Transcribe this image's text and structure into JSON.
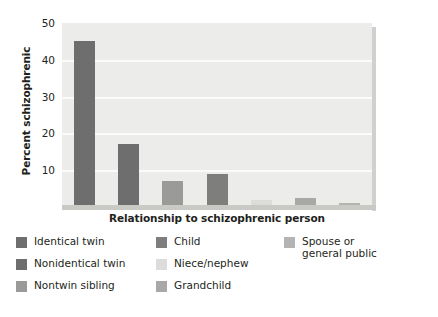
{
  "chart_data": {
    "type": "bar",
    "title": "",
    "xlabel": "Relationship to schizophrenic person",
    "ylabel": "Percent schizophrenic",
    "categories": [
      "Identical twin",
      "Nonidentical twin",
      "Nontwin sibling",
      "Child",
      "Niece/nephew",
      "Grandchild",
      "Spouse or general public"
    ],
    "values": [
      45,
      17,
      7,
      9,
      2,
      2.5,
      1
    ],
    "colors": [
      "#6e6e6e",
      "#6e6e6e",
      "#9a9a98",
      "#7e7e7c",
      "#dcdcda",
      "#a8a8a6",
      "#b4b4b2"
    ],
    "ylim": [
      0,
      50
    ],
    "yticks": [
      10,
      20,
      30,
      40,
      50
    ],
    "ytick_labels": [
      "10",
      "20",
      "30",
      "40",
      "50"
    ],
    "xtick_labels": [],
    "grid": "horizontal",
    "legend_position": "below",
    "plot_background": "#ececeb",
    "gridline_color": "#fbfbfa"
  },
  "legend": {
    "columns": [
      {
        "items": [
          {
            "label": "Identical twin",
            "color": "#6e6e6e"
          },
          {
            "label": "Nonidentical twin",
            "color": "#6e6e6e"
          },
          {
            "label": "Nontwin sibling",
            "color": "#9a9a98"
          }
        ]
      },
      {
        "items": [
          {
            "label": "Child",
            "color": "#7e7e7c"
          },
          {
            "label": "Niece/nephew",
            "color": "#dcdcda"
          },
          {
            "label": "Grandchild",
            "color": "#a8a8a6"
          }
        ]
      },
      {
        "items": [
          {
            "label": "Spouse or\ngeneral public",
            "color": "#b4b4b2"
          }
        ]
      }
    ]
  }
}
